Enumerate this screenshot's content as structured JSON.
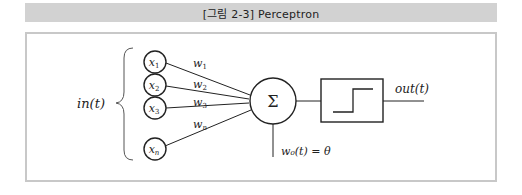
{
  "figure": {
    "caption": "[그림 2-3] Perceptron"
  },
  "diagram": {
    "input_label": "in(t)",
    "inputs": [
      {
        "symbol": "x",
        "subscript": "1",
        "weight": "w",
        "weight_subscript": "1"
      },
      {
        "symbol": "x",
        "subscript": "2",
        "weight": "w",
        "weight_subscript": "2"
      },
      {
        "symbol": "x",
        "subscript": "3",
        "weight": "w",
        "weight_subscript": "3"
      },
      {
        "symbol": "x",
        "subscript": "n",
        "weight": "w",
        "weight_subscript": "n"
      }
    ],
    "summation_symbol": "Σ",
    "bias_label": "w₀(t) = θ",
    "activation": "step-function",
    "output_label": "out(t)"
  },
  "colors": {
    "title_bg": "#d2d2d2",
    "frame_border": "#c8c8c8",
    "stroke": "#222222"
  }
}
